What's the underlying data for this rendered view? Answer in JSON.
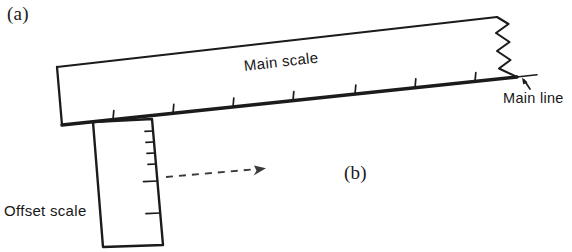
{
  "figure": {
    "width": 572,
    "height": 252,
    "background_color": "#ffffff",
    "ink_color": "#1b1b1b"
  },
  "panels": [
    {
      "id": "a",
      "label": "(a)"
    },
    {
      "id": "b",
      "label": "(b)"
    }
  ],
  "annotations": {
    "main_scale": "Main scale",
    "main_line": "Main line",
    "offset_scale": "Offset scale"
  },
  "geometry": {
    "main_scale_body": {
      "top_left": [
        57,
        67
      ],
      "top_right": [
        497,
        17
      ],
      "right_break_bottom": [
        517,
        77
      ],
      "bottom_left": [
        62,
        125
      ]
    },
    "main_line_extension": {
      "from": [
        517,
        77
      ],
      "to": [
        537,
        75
      ]
    },
    "main_scale_ticks_x": [
      113,
      173,
      233,
      293,
      355,
      415,
      475
    ],
    "main_scale_tick_length": 9,
    "offset_scale_body": {
      "top_left": [
        93,
        122
      ],
      "top_right": [
        152,
        119
      ],
      "bottom_right": [
        163,
        245
      ],
      "bottom_left": [
        103,
        247
      ]
    },
    "offset_scale_ticks": [
      {
        "y": 131,
        "length": 8
      },
      {
        "y": 142,
        "length": 8
      },
      {
        "y": 153,
        "length": 8
      },
      {
        "y": 164,
        "length": 8
      },
      {
        "y": 181,
        "length": 14
      },
      {
        "y": 213,
        "length": 14
      }
    ],
    "dashed_arrow": {
      "from": [
        166,
        177
      ],
      "to": [
        266,
        168
      ]
    },
    "main_line_pointer": {
      "from": [
        529,
        88
      ],
      "to": [
        522,
        78
      ]
    },
    "zigzag_break": [
      [
        497,
        17
      ],
      [
        508,
        24
      ],
      [
        496,
        33
      ],
      [
        509,
        42
      ],
      [
        497,
        51
      ],
      [
        510,
        60
      ],
      [
        499,
        68
      ],
      [
        517,
        77
      ]
    ]
  }
}
